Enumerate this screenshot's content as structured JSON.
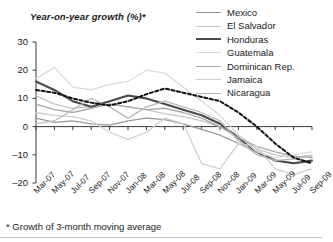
{
  "chart_data": {
    "type": "line",
    "title": "Year-on-year growth (%)*",
    "footnote": "* Growth of 3-month moving average",
    "xlabel": "",
    "ylabel": "Year-on-year growth (%)",
    "ylim": [
      -20,
      30
    ],
    "yticks": [
      30,
      20,
      10,
      0,
      -10,
      -20
    ],
    "grid": false,
    "legend_position": "top-right",
    "x": [
      "Mar-07",
      "May-07",
      "Jul-07",
      "Sep-07",
      "Nov-07",
      "Jan-08",
      "Mar-08",
      "May-08",
      "Jul-08",
      "Sep-08",
      "Nov-08",
      "Jan-09",
      "Mar-09",
      "May-09",
      "Jul-09",
      "Sep-09"
    ],
    "xticks": [
      "Mar-07",
      "May-07",
      "Jul-07",
      "Sep-07",
      "Nov-07",
      "Jan-08",
      "Mar-08",
      "May-08",
      "Jul-08",
      "Sep-08",
      "Nov-08",
      "Jan-09",
      "Mar-09",
      "May-09",
      "Jul-09",
      "Sep-09"
    ],
    "series": [
      {
        "name": "Mexico",
        "color": "#9a9a9a",
        "width": 1.3,
        "dash": "none",
        "values": [
          3.0,
          1.5,
          2.0,
          1.0,
          0.5,
          2.0,
          3.0,
          2.5,
          1.0,
          -1.0,
          -3.0,
          -6.0,
          -9.0,
          -12.0,
          -13.0,
          -12.5
        ]
      },
      {
        "name": "El Salvador",
        "color": "#c6c6c6",
        "width": 1.3,
        "dash": "none",
        "values": [
          11.0,
          8.0,
          6.5,
          7.0,
          8.0,
          7.0,
          6.0,
          4.5,
          3.5,
          2.0,
          0.0,
          -3.0,
          -8.0,
          -10.0,
          -11.0,
          -10.0
        ]
      },
      {
        "name": "Honduras",
        "color": "#4a4a4a",
        "width": 2.1,
        "dash": "none",
        "values": [
          16.0,
          13.0,
          9.0,
          7.0,
          9.0,
          11.0,
          10.0,
          8.0,
          6.0,
          4.0,
          1.0,
          -4.0,
          -9.0,
          -12.0,
          -13.0,
          -12.0
        ]
      },
      {
        "name": "Guatemala",
        "color": "#dadada",
        "width": 1.3,
        "dash": "none",
        "values": [
          17.0,
          21.0,
          14.0,
          13.0,
          15.0,
          16.0,
          20.0,
          19.0,
          14.0,
          9.0,
          4.0,
          -3.0,
          -9.0,
          -11.0,
          -10.0,
          -9.0
        ]
      },
      {
        "name": "Dominican Rep.",
        "color": "#a8a8a8",
        "width": 1.3,
        "dash": "none",
        "values": [
          8.0,
          6.0,
          5.0,
          6.5,
          8.0,
          7.0,
          6.0,
          6.5,
          5.0,
          3.0,
          0.0,
          -4.0,
          -7.0,
          -9.0,
          -10.5,
          -11.0
        ]
      },
      {
        "name": "Jamaica",
        "color": "#cfcfcf",
        "width": 1.3,
        "dash": "none",
        "values": [
          5.0,
          4.0,
          3.5,
          2.0,
          -2.0,
          -4.5,
          -2.0,
          3.0,
          1.0,
          -13.0,
          -15.0,
          -6.0,
          -7.0,
          -15.0,
          -17.0,
          -15.0
        ]
      },
      {
        "name": "Nicaragua",
        "color": "#b8b8b8",
        "width": 1.3,
        "dash": "none",
        "values": [
          1.0,
          2.0,
          6.0,
          10.0,
          7.0,
          3.0,
          7.0,
          9.0,
          7.0,
          5.0,
          2.0,
          -5.0,
          -10.0,
          -12.0,
          -11.5,
          -10.5
        ]
      },
      {
        "name": "Average",
        "color": "#111111",
        "width": 2.0,
        "dash": "3.2 2.4",
        "values": [
          13.0,
          12.0,
          10.0,
          8.5,
          7.5,
          9.0,
          11.5,
          13.5,
          12.0,
          10.5,
          9.0,
          5.0,
          0.0,
          -6.0,
          -11.0,
          -13.0
        ]
      }
    ]
  }
}
